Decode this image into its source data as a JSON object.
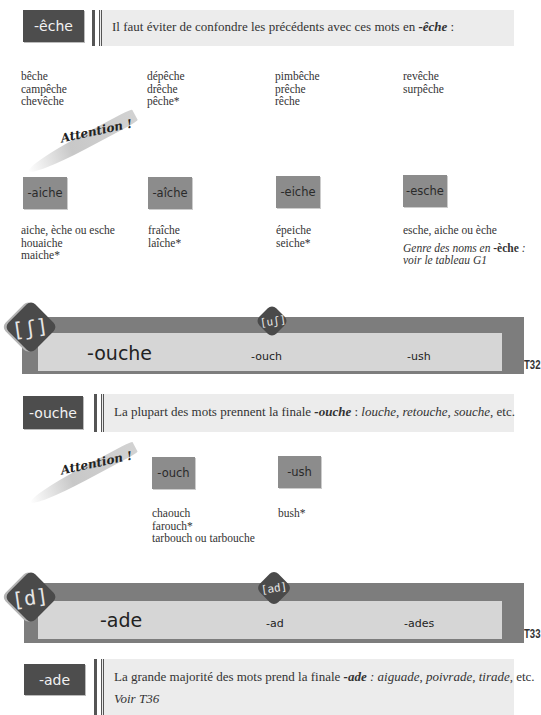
{
  "section_eche": {
    "tag": "-êche",
    "note_prefix": "Il faut éviter de confondre les précédents avec ces mots en ",
    "note_ending": "-êche",
    "note_suffix": " :",
    "columns": [
      [
        "bêche",
        "campêche",
        "chevêche"
      ],
      [
        "dépêche",
        "drêche",
        "pêche*"
      ],
      [
        "pimbêche",
        "prêche",
        "rêche"
      ],
      [
        "revêche",
        "surpêche"
      ]
    ],
    "attention_label": "Attention !",
    "exceptions": [
      {
        "tag": "-aiche",
        "words": [
          "aiche, èche ou esche",
          "houaiche",
          "maiche*"
        ]
      },
      {
        "tag": "-aîche",
        "words": [
          "fraîche",
          "laîche*"
        ]
      },
      {
        "tag": "-eiche",
        "words": [
          "épeiche",
          "seiche*"
        ]
      },
      {
        "tag": "-esche",
        "words": [
          "esche, aiche ou èche"
        ],
        "note_prefix": "Genre des noms en ",
        "note_ending": "-èche",
        "note_suffix": " :",
        "note_line2": "voir le tableau G1"
      }
    ]
  },
  "banner_t32": {
    "phoneme_main": "[ʃ]",
    "phoneme_secondary": "[uʃ]",
    "main_ending": "-ouche",
    "alt_endings": [
      "-ouch",
      "-ush"
    ],
    "table_code": "T32"
  },
  "section_ouche": {
    "tag": "-ouche",
    "note_prefix": "La plupart des mots prennent la finale ",
    "note_ending": "-ouche",
    "note_middle": " : ",
    "examples": [
      "louche",
      "retouche",
      "souche"
    ],
    "note_suffix": "etc.",
    "attention_label": "Attention !",
    "exceptions": [
      {
        "tag": "-ouch",
        "words": [
          "chaouch",
          "farouch*",
          "tarbouch ou tarbouche"
        ]
      },
      {
        "tag": "-ush",
        "words": [
          "bush*"
        ]
      }
    ]
  },
  "banner_t33": {
    "phoneme_main": "[d]",
    "phoneme_secondary": "[ad]",
    "main_ending": "-ade",
    "alt_endings": [
      "-ad",
      "-ades"
    ],
    "table_code": "T33"
  },
  "section_ade": {
    "tag": "-ade",
    "note_prefix": "La grande majorité des mots prend la finale ",
    "note_ending": "-ade",
    "note_middle": " : ",
    "examples": [
      "aiguade",
      "poivrade",
      "tirade"
    ],
    "note_suffix": "etc.",
    "see_also": "Voir T36"
  }
}
